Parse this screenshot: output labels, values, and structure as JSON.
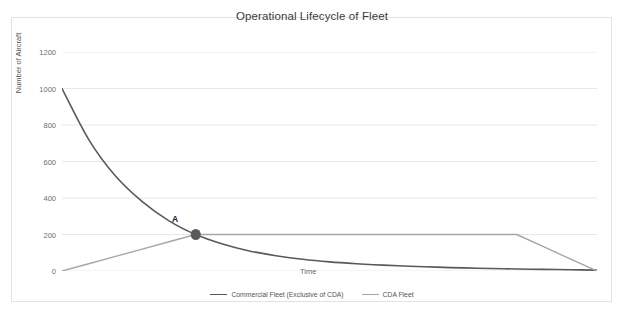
{
  "chart_data": {
    "type": "line",
    "title": "Operational Lifecycle of Fleet",
    "xlabel": "Time",
    "ylabel": "Number of Aircraft",
    "ylim": [
      0,
      1200
    ],
    "yticks": [
      1200,
      1000,
      800,
      600,
      400,
      200,
      0
    ],
    "xticks": [],
    "grid": "horizontal",
    "legend_position": "bottom",
    "x": [
      0,
      5,
      10,
      15,
      20,
      25,
      30,
      35,
      40,
      45,
      50,
      55,
      60,
      65,
      70,
      75,
      80,
      85,
      90,
      95,
      100
    ],
    "series": [
      {
        "name": "Commercial Fleet (Exclusive of CDA)",
        "color": "#595959",
        "values": [
          1000,
          720,
          520,
          380,
          275,
          200,
          148,
          110,
          84,
          64,
          50,
          40,
          32,
          26,
          21,
          17,
          14,
          11,
          9,
          7,
          5
        ]
      },
      {
        "name": "CDA Fleet",
        "color": "#a6a6a6",
        "values": [
          0,
          40,
          80,
          120,
          160,
          200,
          200,
          200,
          200,
          200,
          200,
          200,
          200,
          200,
          200,
          200,
          200,
          200,
          133,
          66,
          0
        ]
      }
    ],
    "annotations": [
      {
        "label": "A",
        "x": 25,
        "y": 200,
        "marker": "dot",
        "marker_color": "#595959",
        "description": "Crossover point where Commercial Fleet and CDA Fleet are equal"
      }
    ],
    "colors": {
      "commercial_fleet": "#595959",
      "cda_fleet": "#a6a6a6",
      "gridline": "#e8e8e8",
      "border": "#e2e2e2",
      "tick_text": "#6e6e6e",
      "title_text": "#3b3b3b"
    }
  }
}
